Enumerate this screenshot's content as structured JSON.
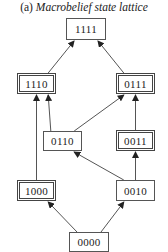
{
  "title": {
    "prefix": "(a)",
    "text": "Macrobelief state lattice"
  },
  "nodes": [
    {
      "id": "1111",
      "label": "1111",
      "border": "single",
      "x": 66,
      "y": 18,
      "w": 40,
      "h": 22
    },
    {
      "id": "1110",
      "label": "1110",
      "border": "double",
      "x": 17,
      "y": 73,
      "w": 39,
      "h": 21
    },
    {
      "id": "0111",
      "label": "0111",
      "border": "double",
      "x": 116,
      "y": 73,
      "w": 39,
      "h": 21
    },
    {
      "id": "0110",
      "label": "0110",
      "border": "single",
      "x": 43,
      "y": 131,
      "w": 39,
      "h": 20
    },
    {
      "id": "0011",
      "label": "0011",
      "border": "double",
      "x": 116,
      "y": 130,
      "w": 39,
      "h": 21
    },
    {
      "id": "1000",
      "label": "1000",
      "border": "double",
      "x": 17,
      "y": 180,
      "w": 39,
      "h": 21
    },
    {
      "id": "0010",
      "label": "0010",
      "border": "single",
      "x": 116,
      "y": 180,
      "w": 39,
      "h": 21
    },
    {
      "id": "0000",
      "label": "0000",
      "border": "single",
      "x": 69,
      "y": 232,
      "w": 40,
      "h": 20
    }
  ],
  "edges": [
    {
      "from": "1110",
      "to": "1111"
    },
    {
      "from": "0111",
      "to": "1111"
    },
    {
      "from": "1000",
      "to": "1110"
    },
    {
      "from": "0110",
      "to": "1110"
    },
    {
      "from": "0110",
      "to": "0111"
    },
    {
      "from": "0011",
      "to": "0111"
    },
    {
      "from": "0010",
      "to": "0110"
    },
    {
      "from": "0010",
      "to": "0011"
    },
    {
      "from": "0000",
      "to": "1000"
    },
    {
      "from": "0000",
      "to": "0010"
    }
  ],
  "colors": {
    "line": "#555555",
    "text": "#222222",
    "background": "#ffffff"
  }
}
